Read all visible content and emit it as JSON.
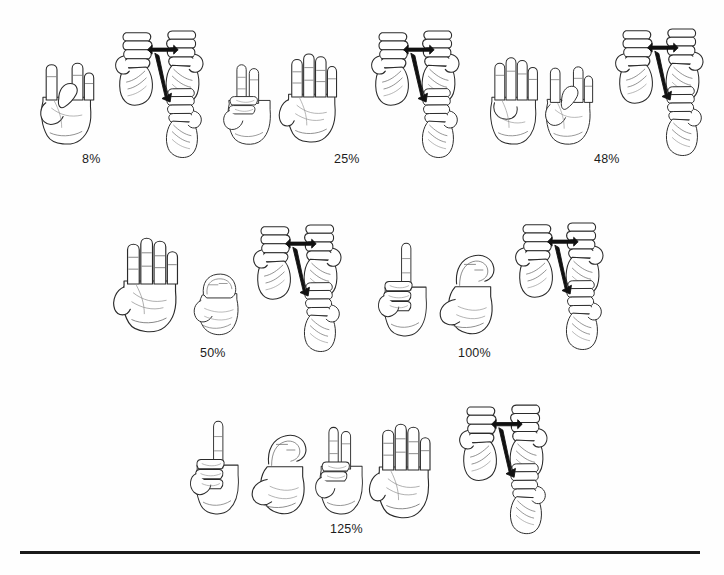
{
  "page": {
    "width": 724,
    "height": 575,
    "background_color": "#fefefe",
    "ink_color": "#2b2b2b",
    "detail_color": "#6a6a6a",
    "arrow_color": "#111111",
    "rule_color": "#1a1a1a"
  },
  "rows": [
    {
      "name": "row-1",
      "groups": [
        {
          "id": "group-8-percent",
          "caption": "8%",
          "caption_x": 82,
          "caption_y": 152,
          "hands": [
            {
              "name": "handshape-8",
              "glyph": "8",
              "x": 30,
              "y": 52,
              "w": 72,
              "h": 96,
              "type": "digit"
            },
            {
              "name": "percent-sign-motion",
              "glyph": "%",
              "x": 108,
              "y": 18,
              "w": 108,
              "h": 132,
              "type": "percent"
            }
          ]
        },
        {
          "id": "group-25-percent",
          "caption": "25%",
          "caption_x": 334,
          "caption_y": 152,
          "hands": [
            {
              "name": "handshape-2",
              "glyph": "2",
              "x": 218,
              "y": 58,
              "w": 62,
              "h": 90,
              "type": "digit"
            },
            {
              "name": "handshape-5",
              "glyph": "5",
              "x": 276,
              "y": 48,
              "w": 70,
              "h": 98,
              "type": "digit"
            },
            {
              "name": "percent-sign-motion",
              "glyph": "%",
              "x": 364,
              "y": 18,
              "w": 108,
              "h": 132,
              "type": "percent"
            }
          ]
        },
        {
          "id": "group-48-percent",
          "caption": "48%",
          "caption_x": 594,
          "caption_y": 152,
          "hands": [
            {
              "name": "handshape-4",
              "glyph": "4",
              "x": 480,
              "y": 52,
              "w": 66,
              "h": 96,
              "type": "digit"
            },
            {
              "name": "handshape-8",
              "glyph": "8",
              "x": 536,
              "y": 56,
              "w": 64,
              "h": 92,
              "type": "digit"
            },
            {
              "name": "percent-sign-motion",
              "glyph": "%",
              "x": 608,
              "y": 16,
              "w": 108,
              "h": 132,
              "type": "percent"
            }
          ]
        }
      ]
    },
    {
      "name": "row-2",
      "groups": [
        {
          "id": "group-50-percent",
          "caption": "50%",
          "caption_x": 200,
          "caption_y": 346,
          "hands": [
            {
              "name": "handshape-5",
              "glyph": "5",
              "x": 110,
              "y": 232,
              "w": 78,
              "h": 104,
              "type": "digit"
            },
            {
              "name": "handshape-0",
              "glyph": "0",
              "x": 186,
              "y": 248,
              "w": 62,
              "h": 92,
              "type": "digit"
            },
            {
              "name": "percent-sign-motion",
              "glyph": "%",
              "x": 246,
              "y": 212,
              "w": 108,
              "h": 132,
              "type": "percent"
            }
          ]
        },
        {
          "id": "group-100-percent",
          "caption": "100%",
          "caption_x": 458,
          "caption_y": 346,
          "hands": [
            {
              "name": "handshape-1",
              "glyph": "1",
              "x": 374,
              "y": 240,
              "w": 62,
              "h": 100,
              "type": "digit"
            },
            {
              "name": "handshape-c-hundred",
              "glyph": "C",
              "x": 430,
              "y": 242,
              "w": 74,
              "h": 98,
              "type": "digit"
            },
            {
              "name": "percent-sign-motion",
              "glyph": "%",
              "x": 508,
              "y": 210,
              "w": 108,
              "h": 132,
              "type": "percent"
            }
          ]
        }
      ]
    },
    {
      "name": "row-3",
      "groups": [
        {
          "id": "group-125-percent",
          "caption": "125%",
          "caption_x": 330,
          "caption_y": 522,
          "hands": [
            {
              "name": "handshape-1",
              "glyph": "1",
              "x": 186,
              "y": 418,
              "w": 62,
              "h": 100,
              "type": "digit"
            },
            {
              "name": "handshape-c-hundred",
              "glyph": "C",
              "x": 242,
              "y": 422,
              "w": 74,
              "h": 98,
              "type": "digit"
            },
            {
              "name": "handshape-2",
              "glyph": "2",
              "x": 310,
              "y": 420,
              "w": 62,
              "h": 98,
              "type": "digit"
            },
            {
              "name": "handshape-5",
              "glyph": "5",
              "x": 366,
              "y": 418,
              "w": 74,
              "h": 104,
              "type": "digit"
            },
            {
              "name": "percent-sign-motion",
              "glyph": "%",
              "x": 452,
              "y": 392,
              "w": 108,
              "h": 134,
              "type": "percent"
            }
          ]
        }
      ]
    }
  ],
  "bottom_rule": {
    "name": "page-bottom-rule",
    "x": 20,
    "y": 551,
    "width": 680,
    "height": 3
  }
}
